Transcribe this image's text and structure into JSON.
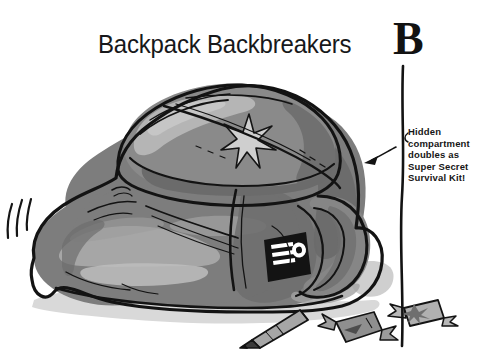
{
  "page": {
    "background_color": "#ffffff",
    "width": 489,
    "height": 358,
    "kind": "cartoon-illustration"
  },
  "title": "Backpack Backbreakers",
  "section_letter": "B",
  "callout": {
    "text": "Hidden\ncompartment\ndoubles as\nSuper Secret\nSurvival Kit!",
    "lines": [
      "Hidden",
      "compartment",
      "doubles as",
      "Super Secret",
      "Survival Kit!"
    ]
  },
  "illustration": {
    "subject": "overstuffed backpack",
    "star_emblem": "six-point-star",
    "patch": "black rectangular patch with three white bars and white dot",
    "spilled_items": [
      "pencil",
      "wrapped-candy",
      "wrapped-candy"
    ],
    "motion_lines": 3
  },
  "palette": {
    "ink": "#121212",
    "bag_mid": "#7d7d7d",
    "bag_light": "#a9a9a9",
    "bag_lighter": "#c0c0c0",
    "bag_dark": "#5e5e5e",
    "shadow": "#d9d9d9",
    "paper": "#ffffff",
    "patch_black": "#131313",
    "patch_white": "#ffffff"
  }
}
